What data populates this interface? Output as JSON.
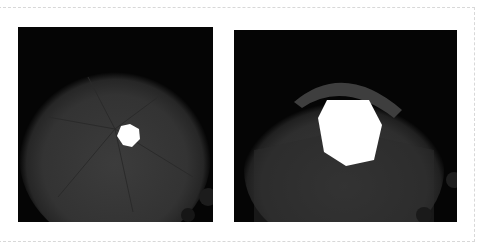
{
  "figure": {
    "panels": [
      {
        "id": "left",
        "description": "Camera lens aperture diaphragm stopped down to a small heptagonal opening",
        "aperture_shape": "heptagon",
        "aperture_size": "small"
      },
      {
        "id": "right",
        "description": "Camera lens aperture diaphragm opened wider to a large heptagonal opening",
        "aperture_shape": "heptagon",
        "aperture_size": "large"
      }
    ],
    "colors": {
      "background": "#ffffff",
      "photo_background": "#050505",
      "lens_glow": "#3a3a3a",
      "aperture_light": "#ffffff",
      "frame_border": "#d8d8d8"
    }
  }
}
